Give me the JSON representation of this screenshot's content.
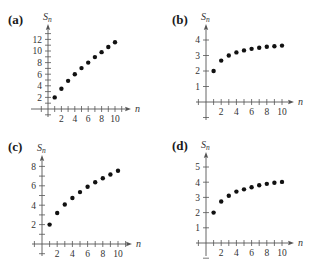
{
  "panels": [
    {
      "label": "(a)",
      "ylabel": "S",
      "ysub": "n",
      "xlabel": "n"
    },
    {
      "label": "(b)",
      "ylabel": "S",
      "ysub": "n",
      "xlabel": "n"
    },
    {
      "label": "(c)",
      "ylabel": "S",
      "ysub": "n",
      "xlabel": "n"
    },
    {
      "label": "(d)",
      "ylabel": "S",
      "ysub": "n",
      "xlabel": "n"
    }
  ],
  "chart_data": [
    {
      "type": "scatter",
      "title": "(a)",
      "xlabel": "n",
      "ylabel": "S_n",
      "x": [
        1,
        2,
        3,
        4,
        5,
        6,
        7,
        8,
        9,
        10
      ],
      "values": [
        2.0,
        3.5,
        4.85,
        6.0,
        7.05,
        8.0,
        8.95,
        9.8,
        10.7,
        11.5
      ],
      "xticks": [
        2,
        4,
        6,
        8,
        10
      ],
      "yticks": [
        2,
        4,
        6,
        8,
        10,
        12
      ],
      "yminor": [
        1,
        3,
        5,
        7,
        9,
        11,
        13
      ],
      "xlim": [
        -1,
        11
      ],
      "ylim": [
        -1,
        13.5
      ],
      "grid": false,
      "geom": {
        "ox": 48,
        "oy": 109,
        "sx": 6.7,
        "sy": 5.8,
        "xl": 31,
        "xr": 127,
        "yt": 28,
        "yb": 117
      }
    },
    {
      "type": "scatter",
      "title": "(b)",
      "xlabel": "n",
      "ylabel": "S_n",
      "x": [
        1,
        2,
        3,
        4,
        5,
        6,
        7,
        8,
        9,
        10
      ],
      "values": [
        2.0,
        2.67,
        3.0,
        3.2,
        3.33,
        3.43,
        3.5,
        3.56,
        3.6,
        3.64
      ],
      "xticks": [
        2,
        4,
        6,
        8,
        10
      ],
      "yticks": [
        1,
        2,
        3,
        4
      ],
      "yminor": [],
      "xlim": [
        -1,
        11
      ],
      "ylim": [
        -1,
        4.7
      ],
      "grid": false,
      "geom": {
        "ox": 51,
        "oy": 102,
        "sx": 7.6,
        "sy": 15.5,
        "xl": 41,
        "xr": 135,
        "yt": 28,
        "yb": 120
      }
    },
    {
      "type": "scatter",
      "title": "(c)",
      "xlabel": "n",
      "ylabel": "S_n",
      "x": [
        1,
        2,
        3,
        4,
        5,
        6,
        7,
        8,
        9,
        10
      ],
      "values": [
        2.0,
        3.2,
        4.07,
        4.74,
        5.35,
        5.9,
        6.37,
        6.78,
        7.16,
        7.55
      ],
      "xticks": [
        2,
        4,
        6,
        8,
        10
      ],
      "yticks": [
        2,
        4,
        6,
        8
      ],
      "yminor": [
        1,
        3,
        5,
        7
      ],
      "xlim": [
        -1,
        11
      ],
      "ylim": [
        -0.5,
        8.7
      ],
      "grid": false,
      "geom": {
        "ox": 42,
        "oy": 110,
        "sx": 7.6,
        "sy": 9.7,
        "xl": 32,
        "xr": 128,
        "yt": 25,
        "yb": 122
      }
    },
    {
      "type": "scatter",
      "title": "(d)",
      "xlabel": "n",
      "ylabel": "S_n",
      "x": [
        1,
        2,
        3,
        4,
        5,
        6,
        7,
        8,
        9,
        10
      ],
      "values": [
        2.0,
        2.73,
        3.11,
        3.38,
        3.53,
        3.67,
        3.8,
        3.89,
        3.96,
        4.02
      ],
      "xticks": [
        2,
        4,
        6,
        8,
        10
      ],
      "yticks": [
        1,
        2,
        3,
        4,
        5
      ],
      "yminor": [],
      "xlim": [
        -1,
        11
      ],
      "ylim": [
        -0.8,
        5.7
      ],
      "grid": false,
      "geom": {
        "ox": 51,
        "oy": 109,
        "sx": 7.6,
        "sy": 15.2,
        "xl": 41,
        "xr": 135,
        "yt": 22,
        "yb": 122
      }
    }
  ]
}
